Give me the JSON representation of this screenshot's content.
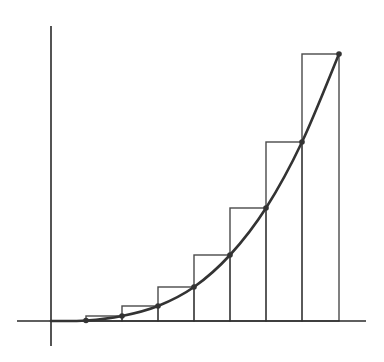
{
  "diagram": {
    "type": "riemann-sum-upper",
    "colors": {
      "axis": "#2a2a2a",
      "rect": "#4a4a4a",
      "curve": "#333333",
      "background": "#ffffff"
    },
    "axes": {
      "x_axis": {
        "x1": 17,
        "x2": 366,
        "y": 321
      },
      "y_axis": {
        "x": 51,
        "y1": 26,
        "y2": 346
      }
    },
    "rectangles": [
      {
        "x": 86,
        "right": 122,
        "top": 316
      },
      {
        "x": 122,
        "right": 158,
        "top": 306
      },
      {
        "x": 158,
        "right": 194,
        "top": 287
      },
      {
        "x": 194,
        "right": 230,
        "top": 255
      },
      {
        "x": 230,
        "right": 266,
        "top": 208
      },
      {
        "x": 266,
        "right": 302,
        "top": 142
      },
      {
        "x": 302,
        "right": 339,
        "top": 54
      }
    ],
    "curve_points": [
      [
        51,
        321
      ],
      [
        86,
        320.5
      ],
      [
        122,
        316
      ],
      [
        158,
        306
      ],
      [
        194,
        287
      ],
      [
        230,
        255
      ],
      [
        266,
        208
      ],
      [
        302,
        142
      ],
      [
        339,
        54
      ]
    ]
  }
}
